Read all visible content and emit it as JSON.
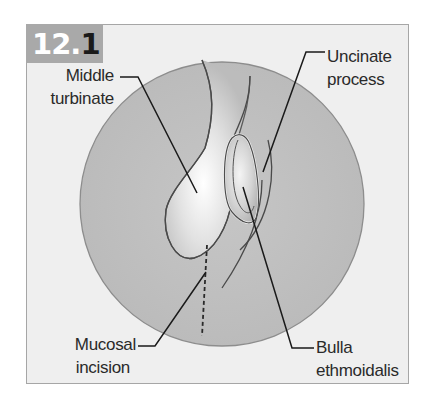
{
  "figure": {
    "number_prefix": "12.",
    "number_suffix": "1",
    "colors": {
      "frame_bg": "#efefef",
      "frame_border": "#a6a6a6",
      "badge_bg": "#a9a9a9",
      "circle_fill": "#bdbdbd",
      "leader_line": "#1a1a1a"
    }
  },
  "labels": {
    "middle_turbinate": {
      "line1": "Middle",
      "line2": "turbinate"
    },
    "uncinate_process": {
      "line1": "Uncinate",
      "line2": "process"
    },
    "mucosal_incision": {
      "line1": "Mucosal",
      "line2": "incision"
    },
    "bulla_ethmoidalis": {
      "line1": "Bulla",
      "line2": "ethmoidalis"
    }
  }
}
